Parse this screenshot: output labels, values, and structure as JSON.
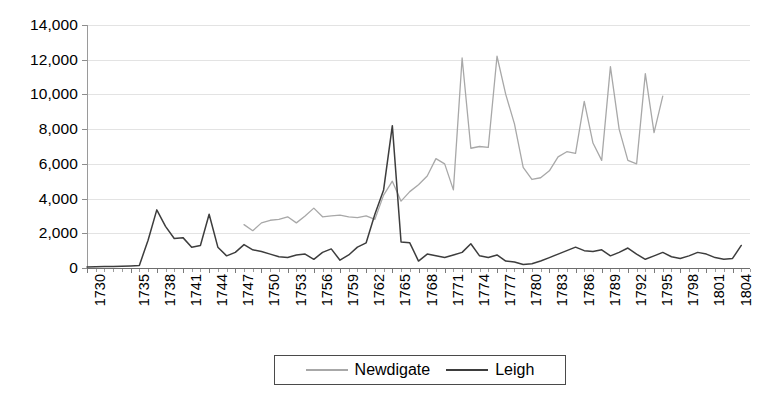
{
  "chart_data": {
    "type": "line",
    "title": "",
    "xlabel": "",
    "ylabel": "",
    "grid": true,
    "legend_position": "bottom",
    "xlim": [
      1730,
      1806
    ],
    "ylim": [
      0,
      14000
    ],
    "ytick_labels": [
      "14,000",
      "12,000",
      "10,000",
      "8,000",
      "6,000",
      "4,000",
      "2,000",
      "0"
    ],
    "ytick_values": [
      14000,
      12000,
      10000,
      8000,
      6000,
      4000,
      2000,
      0
    ],
    "xtick_labels": [
      "1730",
      "1735",
      "1738",
      "1741",
      "1744",
      "1747",
      "1750",
      "1753",
      "1756",
      "1759",
      "1762",
      "1765",
      "1768",
      "1771",
      "1774",
      "1777",
      "1780",
      "1783",
      "1786",
      "1789",
      "1792",
      "1795",
      "1798",
      "1801",
      "1804"
    ],
    "xtick_values": [
      1730,
      1735,
      1738,
      1741,
      1744,
      1747,
      1750,
      1753,
      1756,
      1759,
      1762,
      1765,
      1768,
      1771,
      1774,
      1777,
      1780,
      1783,
      1786,
      1789,
      1792,
      1795,
      1798,
      1801,
      1804
    ],
    "series": [
      {
        "name": "Newdigate",
        "color": "#a8a8a8",
        "x": [
          1748,
          1749,
          1750,
          1751,
          1752,
          1753,
          1754,
          1755,
          1756,
          1757,
          1758,
          1759,
          1760,
          1761,
          1762,
          1763,
          1764,
          1765,
          1766,
          1767,
          1768,
          1769,
          1770,
          1771,
          1772,
          1773,
          1774,
          1775,
          1776,
          1777,
          1778,
          1779,
          1780,
          1781,
          1782,
          1783,
          1784,
          1785,
          1786,
          1787,
          1788,
          1789,
          1790,
          1791,
          1792,
          1793,
          1794,
          1795,
          1796
        ],
        "values": [
          2500,
          2150,
          2600,
          2750,
          2800,
          2950,
          2600,
          3000,
          3450,
          2950,
          3000,
          3050,
          2950,
          2900,
          3000,
          2800,
          4200,
          5000,
          3850,
          4400,
          4800,
          5300,
          6300,
          6000,
          4500,
          12100,
          6900,
          7000,
          6950,
          12200,
          10000,
          8300,
          5800,
          5100,
          5200,
          5600,
          6400,
          6700,
          6600,
          9600,
          7200,
          6200,
          11600,
          8000,
          6200,
          6000,
          11200,
          7800,
          9900
        ]
      },
      {
        "name": "Leigh",
        "color": "#3d3d3d",
        "x": [
          1730,
          1731,
          1732,
          1733,
          1734,
          1735,
          1736,
          1737,
          1738,
          1739,
          1740,
          1741,
          1742,
          1743,
          1744,
          1745,
          1746,
          1747,
          1748,
          1749,
          1750,
          1751,
          1752,
          1753,
          1754,
          1755,
          1756,
          1757,
          1758,
          1759,
          1760,
          1761,
          1762,
          1763,
          1764,
          1765,
          1766,
          1767,
          1768,
          1769,
          1770,
          1771,
          1772,
          1773,
          1774,
          1775,
          1776,
          1777,
          1778,
          1779,
          1780,
          1781,
          1782,
          1783,
          1784,
          1785,
          1786,
          1787,
          1788,
          1789,
          1790,
          1791,
          1792,
          1793,
          1794,
          1795,
          1796,
          1797,
          1798,
          1799,
          1800,
          1801,
          1802,
          1803,
          1804,
          1805
        ],
        "values": [
          60,
          70,
          80,
          90,
          100,
          120,
          150,
          1600,
          3350,
          2400,
          1700,
          1750,
          1200,
          1300,
          3100,
          1200,
          700,
          900,
          1350,
          1050,
          950,
          800,
          650,
          600,
          750,
          800,
          500,
          900,
          1100,
          450,
          750,
          1200,
          1450,
          3100,
          4500,
          8200,
          1500,
          1450,
          400,
          800,
          700,
          600,
          750,
          900,
          1400,
          700,
          600,
          750,
          400,
          350,
          200,
          250,
          400,
          600,
          800,
          1000,
          1200,
          1000,
          950,
          1050,
          700,
          900,
          1150,
          800,
          500,
          700,
          900,
          650,
          550,
          700,
          900,
          800,
          600,
          500,
          550,
          1300
        ]
      }
    ]
  },
  "legend": {
    "items": [
      {
        "label": "Newdigate",
        "color": "#a8a8a8"
      },
      {
        "label": "Leigh",
        "color": "#3d3d3d"
      }
    ]
  }
}
